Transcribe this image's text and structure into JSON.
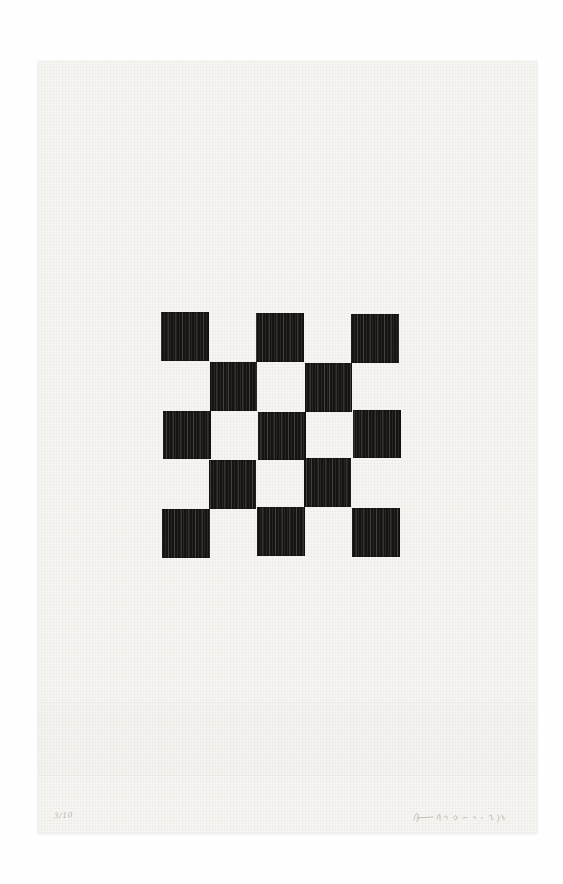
{
  "scene": {
    "description": "Photograph of a black-and-white checkerboard woodcut print on cream woven paper",
    "background_color": "#fefefe"
  },
  "paper": {
    "color": "#f6f5f2",
    "texture": "fine woven crosshatch grid",
    "creases": "two faint horizontal lines across lower third of sheet"
  },
  "checkerboard": {
    "rows": 5,
    "columns": 5,
    "pattern": [
      [
        1,
        0,
        1,
        0,
        1
      ],
      [
        0,
        1,
        0,
        1,
        0
      ],
      [
        1,
        0,
        1,
        0,
        1
      ],
      [
        0,
        1,
        0,
        1,
        0
      ],
      [
        1,
        0,
        1,
        0,
        1
      ]
    ],
    "black_square_count": 13,
    "ink_color": "#151413",
    "grain": "vertical woodgrain streaks in black squares"
  },
  "inscriptions": {
    "edition_label": "3/10",
    "signature_description": "faint illegible pencil signature at bottom right"
  }
}
